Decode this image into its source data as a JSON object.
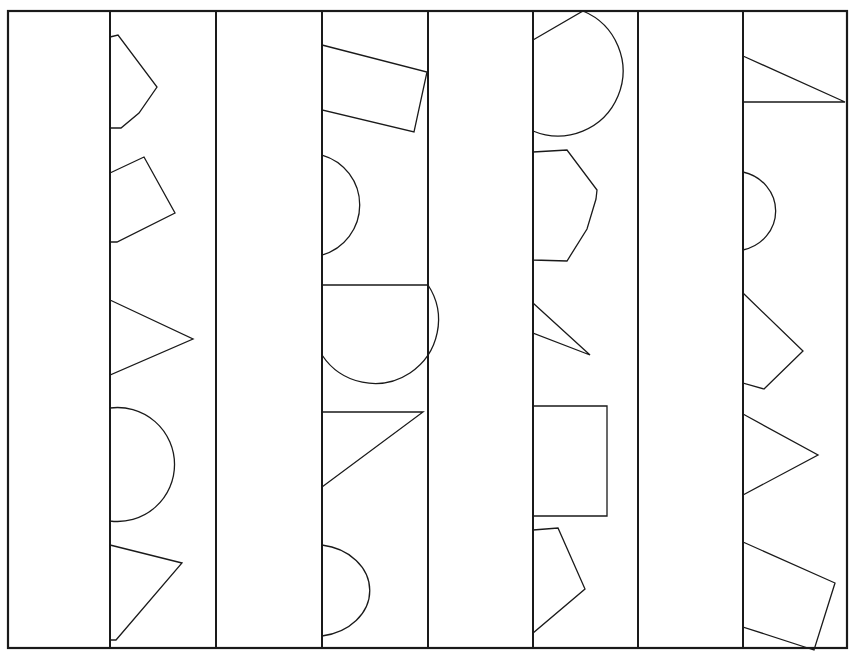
{
  "figure": {
    "width": 855,
    "height": 655,
    "background_color": "#ffffff",
    "stroke_color": "#1a1a1a",
    "fill_color": "none",
    "frame": {
      "name": "outer-frame",
      "x": 8,
      "y": 11,
      "width": 839,
      "height": 637,
      "stroke_width": 2.2
    },
    "vertical_dividers": {
      "name": "vertical-divider-lines",
      "stroke_width": 2.0,
      "x_positions": [
        110,
        216,
        322,
        428,
        533,
        638,
        743
      ],
      "y_top": 11,
      "y_bottom": 648
    },
    "columns": [
      {
        "index": 1,
        "name": "column-1-empty",
        "x_left": 8,
        "x_right": 110,
        "shape_count": 0
      },
      {
        "index": 2,
        "name": "column-2-shapes",
        "x_left": 110,
        "x_right": 216,
        "shape_count": 5
      },
      {
        "index": 3,
        "name": "column-3-empty",
        "x_left": 216,
        "x_right": 322,
        "shape_count": 0
      },
      {
        "index": 4,
        "name": "column-4-shapes",
        "x_left": 322,
        "x_right": 428,
        "shape_count": 5
      },
      {
        "index": 5,
        "name": "column-5-empty",
        "x_left": 428,
        "x_right": 533,
        "shape_count": 0
      },
      {
        "index": 6,
        "name": "column-6-shapes",
        "x_left": 533,
        "x_right": 638,
        "shape_count": 5
      },
      {
        "index": 7,
        "name": "column-7-empty",
        "x_left": 638,
        "x_right": 743,
        "shape_count": 0
      },
      {
        "index": 8,
        "name": "column-8-shapes",
        "x_left": 743,
        "x_right": 847,
        "shape_count": 5
      }
    ],
    "shapes": [
      {
        "id": "c2-s1",
        "column": 2,
        "name": "pentagon-clipped",
        "kind": "polygon",
        "stroke_width": 1.3,
        "points": "110,37 118,35 157,87 139,113 121,128 110,128"
      },
      {
        "id": "c2-s2",
        "column": 2,
        "name": "quadrilateral-tilted",
        "kind": "polygon",
        "stroke_width": 1.3,
        "points": "110,173 144,157 175,213 117,242 110,242"
      },
      {
        "id": "c2-s3",
        "column": 2,
        "name": "triangle-pointing-right",
        "kind": "polygon",
        "stroke_width": 1.3,
        "points": "110,300 193,339 110,375"
      },
      {
        "id": "c2-s4",
        "column": 2,
        "name": "circle-clipped",
        "kind": "path",
        "stroke_width": 1.3,
        "d": "M 110,408 A 57 57 0 1 1 110,521 Z"
      },
      {
        "id": "c2-s5",
        "column": 2,
        "name": "triangle-pointing-down-right",
        "kind": "polygon",
        "stroke_width": 1.3,
        "points": "110,545 182,563 116,640 110,640"
      },
      {
        "id": "c4-s1",
        "column": 4,
        "name": "rectangle-rotated",
        "kind": "polygon",
        "stroke_width": 1.3,
        "points": "322,45 427,72 414,132 322,110"
      },
      {
        "id": "c4-s2",
        "column": 4,
        "name": "half-circle-left-flat",
        "kind": "path",
        "stroke_width": 1.3,
        "d": "M 322,155 A 52 52 0 0 1 322,255 Z"
      },
      {
        "id": "c4-s3",
        "column": 4,
        "name": "semicircle-bottom-half",
        "kind": "path",
        "stroke_width": 1.3,
        "d": "M 322,285 L 428,285 A 53 53 0 0 1 322,355 Z"
      },
      {
        "id": "c4-s4",
        "column": 4,
        "name": "right-triangle-hypotenuse",
        "kind": "polygon",
        "stroke_width": 1.3,
        "points": "322,412 423,412 322,487"
      },
      {
        "id": "c4-s5",
        "column": 4,
        "name": "half-ellipse-right-bulge",
        "kind": "path",
        "stroke_width": 1.3,
        "d": "M 322,545 A 56 46 0 0 1 322,636 Z"
      },
      {
        "id": "c6-s1",
        "column": 6,
        "name": "pie-sector-arc",
        "kind": "path",
        "stroke_width": 1.3,
        "d": "M 533,40 L 583,11 A 65 65 0 0 1 533,131 Z"
      },
      {
        "id": "c6-s2",
        "column": 6,
        "name": "heptagon-clipped",
        "kind": "polygon",
        "stroke_width": 1.3,
        "points": "533,152 567,150 597,190 596,199 587,229 567,261 533,260"
      },
      {
        "id": "c6-s3",
        "column": 6,
        "name": "thin-triangle-sliver",
        "kind": "polygon",
        "stroke_width": 1.3,
        "points": "533,303 590,355 533,333"
      },
      {
        "id": "c6-s4",
        "column": 6,
        "name": "rectangle-upright",
        "kind": "polygon",
        "stroke_width": 1.3,
        "points": "533,406 607,406 607,516 533,516"
      },
      {
        "id": "c6-s5",
        "column": 6,
        "name": "quadrilateral-kite",
        "kind": "polygon",
        "stroke_width": 1.3,
        "points": "533,530 558,528 585,589 533,633"
      },
      {
        "id": "c8-s1",
        "column": 8,
        "name": "triangle-thin-right-point",
        "kind": "polygon",
        "stroke_width": 1.3,
        "points": "743,56 845,102 743,102"
      },
      {
        "id": "c8-s2",
        "column": 8,
        "name": "half-ellipse-clipped",
        "kind": "path",
        "stroke_width": 1.3,
        "d": "M 743,172 A 42 40 0 0 1 743,250 Z"
      },
      {
        "id": "c8-s3",
        "column": 8,
        "name": "quadrilateral-arrow-right",
        "kind": "polygon",
        "stroke_width": 1.3,
        "points": "743,293 803,351 764,389 743,383"
      },
      {
        "id": "c8-s4",
        "column": 8,
        "name": "triangle-chevron",
        "kind": "polygon",
        "stroke_width": 1.3,
        "points": "743,414 818,455 743,495"
      },
      {
        "id": "c8-s5",
        "column": 8,
        "name": "rectangle-rotated-lower",
        "kind": "polygon",
        "stroke_width": 1.3,
        "points": "743,542 835,583 814,650 743,627"
      }
    ]
  }
}
